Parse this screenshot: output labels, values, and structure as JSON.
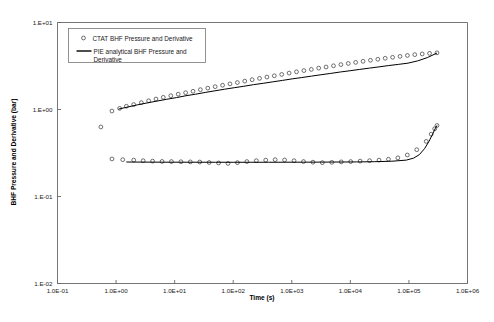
{
  "chart_data": {
    "type": "scatter",
    "title": "",
    "subtitle": "",
    "xlabel": "Time (s)",
    "ylabel": "BHF Pressure and Derivative (bar)",
    "xscale": "log",
    "yscale": "log",
    "xlim": [
      0.1,
      1000000
    ],
    "ylim": [
      0.01,
      10
    ],
    "grid": false,
    "xticklabels": [
      "1.0E-01",
      "1.0E+00",
      "1.0E+01",
      "1.0E+02",
      "1.0E+03",
      "1.0E+04",
      "1.0E+05",
      "1.0E+06"
    ],
    "xtickvalues": [
      0.1,
      1,
      10,
      100,
      1000,
      10000,
      100000,
      1000000
    ],
    "yticklabels": [
      "1.E+01",
      "1.E+00",
      "1.E-01",
      "1.E-02"
    ],
    "ytickvalues": [
      10,
      1,
      0.1,
      0.01
    ],
    "legend_position": "upper-left-inside",
    "legend": [
      {
        "label": "CTAT BHF Pressure and Derivative",
        "marker": "open-circle",
        "style": "markers"
      },
      {
        "label": "PIE analytical BHF Pressure and Derivative",
        "marker": "none",
        "style": "line"
      }
    ],
    "series": [
      {
        "name": "CTAT BHF Pressure and Derivative",
        "style": "markers",
        "marker": "open-circle",
        "x": [
          0.55,
          0.85,
          1.15,
          1.5,
          2.0,
          2.7,
          3.6,
          4.8,
          6.4,
          8.6,
          11.5,
          15.4,
          20.6,
          27.5,
          36.8,
          49.2,
          65.8,
          88.0,
          117.7,
          157.4,
          210.5,
          281.5,
          376.5,
          503.5,
          673.4,
          900.5,
          1204.3,
          1610.3,
          2153.4,
          2879.6,
          3850.8,
          5149.7,
          6886.8,
          9209.0,
          12315.0,
          16468.0,
          22022.0,
          29449.0,
          39381.0,
          52664.0,
          70427.0,
          94181.0,
          125950.0,
          168430.0,
          225230.0,
          301190.0
        ],
        "y": [
          0.63,
          0.96,
          1.03,
          1.09,
          1.14,
          1.2,
          1.26,
          1.32,
          1.38,
          1.44,
          1.5,
          1.56,
          1.62,
          1.69,
          1.76,
          1.83,
          1.9,
          1.97,
          2.04,
          2.12,
          2.2,
          2.28,
          2.36,
          2.44,
          2.53,
          2.62,
          2.71,
          2.8,
          2.89,
          2.99,
          3.08,
          3.18,
          3.28,
          3.38,
          3.48,
          3.58,
          3.68,
          3.78,
          3.88,
          3.98,
          4.08,
          4.18,
          4.27,
          4.35,
          4.42,
          4.48
        ]
      },
      {
        "name": "CTAT BHF Derivative",
        "style": "markers",
        "marker": "open-circle",
        "x": [
          0.85,
          1.3,
          2.0,
          2.9,
          4.2,
          6.1,
          8.8,
          12.8,
          18.5,
          26.8,
          38.8,
          56.2,
          81.5,
          118.0,
          171.0,
          248.0,
          359.0,
          520.0,
          754.0,
          1093.0,
          1584.0,
          2296.0,
          3327.0,
          4823.0,
          6990.0,
          10130.0,
          14680.0,
          21280.0,
          30840.0,
          44690.0,
          64770.0,
          93870.0,
          136050.0,
          197190.0,
          240000.0,
          275000.0,
          301190.0
        ],
        "y": [
          0.27,
          0.265,
          0.262,
          0.258,
          0.255,
          0.253,
          0.252,
          0.251,
          0.25,
          0.249,
          0.246,
          0.243,
          0.24,
          0.245,
          0.252,
          0.258,
          0.262,
          0.265,
          0.263,
          0.258,
          0.252,
          0.248,
          0.245,
          0.247,
          0.25,
          0.252,
          0.255,
          0.258,
          0.262,
          0.268,
          0.278,
          0.3,
          0.345,
          0.43,
          0.52,
          0.6,
          0.655
        ]
      },
      {
        "name": "PIE analytical BHF Pressure",
        "style": "line",
        "x": [
          1.1,
          1.6,
          2.3,
          3.4,
          5.0,
          7.3,
          10.7,
          15.6,
          22.8,
          33.3,
          48.7,
          71.2,
          104.0,
          152.0,
          222.0,
          325.0,
          475.0,
          694.0,
          1015.0,
          1483.0,
          2168.0,
          3169.0,
          4632.0,
          6770.0,
          9896.0,
          14465.0,
          21143.0,
          30903.0,
          45169.0,
          66021.0,
          96500.0,
          141050.0,
          206150.0,
          301190.0
        ],
        "y": [
          1.01,
          1.07,
          1.13,
          1.19,
          1.25,
          1.31,
          1.37,
          1.44,
          1.5,
          1.57,
          1.64,
          1.71,
          1.78,
          1.85,
          1.93,
          2.0,
          2.08,
          2.16,
          2.25,
          2.33,
          2.42,
          2.51,
          2.6,
          2.7,
          2.79,
          2.89,
          2.99,
          3.09,
          3.2,
          3.3,
          3.41,
          3.62,
          3.95,
          4.45
        ]
      },
      {
        "name": "PIE analytical BHF Derivative",
        "style": "line",
        "x": [
          1.5,
          3.0,
          6.0,
          12.0,
          25.0,
          50.0,
          100.0,
          200.0,
          400.0,
          800.0,
          1600.0,
          3200.0,
          6400.0,
          12800.0,
          25600.0,
          51200.0,
          90000.0,
          120000.0,
          150000.0,
          185000.0,
          220000.0,
          255000.0,
          280000.0,
          301190.0
        ],
        "y": [
          0.249,
          0.2485,
          0.248,
          0.2478,
          0.2476,
          0.2475,
          0.2474,
          0.2474,
          0.2475,
          0.2477,
          0.248,
          0.2485,
          0.249,
          0.2498,
          0.2512,
          0.2545,
          0.262,
          0.276,
          0.302,
          0.355,
          0.43,
          0.525,
          0.6,
          0.655
        ]
      }
    ]
  }
}
